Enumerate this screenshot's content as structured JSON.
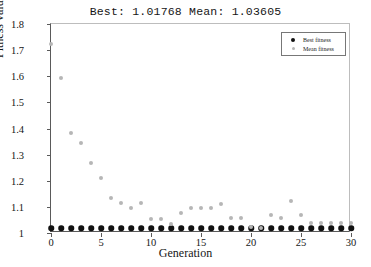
{
  "chart_data": {
    "type": "scatter",
    "title": "Best: 1.01768 Mean: 1.03605",
    "xlabel": "Generation",
    "ylabel": "Fitness value",
    "xlim": [
      0,
      30
    ],
    "ylim": [
      1.0,
      1.8
    ],
    "xticks": [
      0,
      5,
      10,
      15,
      20,
      25,
      30
    ],
    "xtick_labels": [
      "0",
      "5",
      "10",
      "15",
      "20",
      "25",
      "30"
    ],
    "yticks": [
      1,
      1.1,
      1.2,
      1.3,
      1.4,
      1.5,
      1.6,
      1.7,
      1.8
    ],
    "ytick_labels": [
      "1",
      "1.1",
      "1.2",
      "1.3",
      "1.4",
      "1.5",
      "1.6",
      "1.7",
      "1.8"
    ],
    "grid": false,
    "legend_position": "upper right",
    "x": [
      0,
      1,
      2,
      3,
      4,
      5,
      6,
      7,
      8,
      9,
      10,
      11,
      12,
      13,
      14,
      15,
      16,
      17,
      18,
      19,
      20,
      21,
      22,
      23,
      24,
      25,
      26,
      27,
      28,
      29,
      30
    ],
    "series": [
      {
        "name": "Best fitness",
        "marker": "filled-circle",
        "color": "#111111",
        "values": [
          1.018,
          1.018,
          1.018,
          1.018,
          1.018,
          1.018,
          1.018,
          1.018,
          1.018,
          1.018,
          1.018,
          1.018,
          1.018,
          1.018,
          1.018,
          1.018,
          1.018,
          1.018,
          1.018,
          1.018,
          1.018,
          1.018,
          1.018,
          1.018,
          1.018,
          1.018,
          1.018,
          1.018,
          1.018,
          1.018,
          1.018
        ]
      },
      {
        "name": "Mean fitness",
        "marker": "open-circle",
        "color": "#b6b6b6",
        "values": [
          1.725,
          1.595,
          1.382,
          1.343,
          1.268,
          1.21,
          1.135,
          1.116,
          1.096,
          1.116,
          1.055,
          1.054,
          1.036,
          1.075,
          1.096,
          1.096,
          1.096,
          1.11,
          1.057,
          1.057,
          1.022,
          1.021,
          1.07,
          1.056,
          1.122,
          1.07,
          1.04,
          1.04,
          1.04,
          1.04,
          1.038
        ]
      }
    ]
  },
  "legend": {
    "items": [
      {
        "label": "Best fitness"
      },
      {
        "label": "Mean fitness"
      }
    ]
  }
}
